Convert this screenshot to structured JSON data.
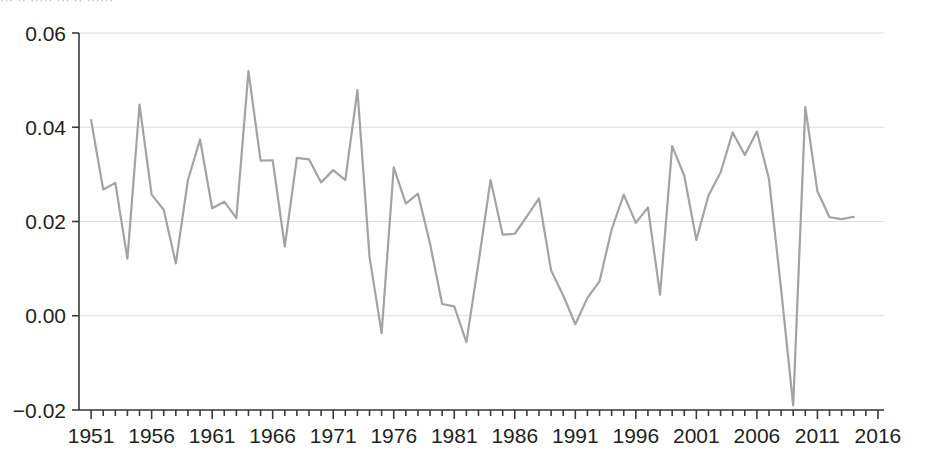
{
  "figure": {
    "clipped_header_text": "··· ·· ····· ··· ·· ······",
    "line_color": "#a3a3a3",
    "grid_color": "#dcdcdc",
    "axis_color": "#3a3a3a",
    "background_color": "#ffffff"
  },
  "chart_data": {
    "type": "line",
    "title": "",
    "xlabel": "",
    "ylabel": "",
    "xlim": [
      1950.0,
      2016.5
    ],
    "ylim": [
      -0.02,
      0.06
    ],
    "grid": true,
    "legend": null,
    "yticks": [
      -0.02,
      0.0,
      0.02,
      0.04,
      0.06
    ],
    "ytick_labels": [
      "−0.02",
      "0.00",
      "0.02",
      "0.04",
      "0.06"
    ],
    "xticks": [
      1951,
      1956,
      1961,
      1966,
      1971,
      1976,
      1981,
      1986,
      1991,
      1996,
      2001,
      2006,
      2011,
      2016
    ],
    "xtick_labels": [
      "1951",
      "1956",
      "1961",
      "1966",
      "1971",
      "1976",
      "1981",
      "1986",
      "1991",
      "1996",
      "2001",
      "2006",
      "2011",
      "2016"
    ],
    "xtick_minor_step": 1,
    "series": [
      {
        "name": "series-1",
        "color": "#a3a3a3",
        "x": [
          1951,
          1952,
          1953,
          1954,
          1955,
          1956,
          1957,
          1958,
          1959,
          1960,
          1961,
          1962,
          1963,
          1964,
          1965,
          1966,
          1967,
          1968,
          1969,
          1970,
          1971,
          1972,
          1973,
          1974,
          1975,
          1976,
          1977,
          1978,
          1979,
          1980,
          1981,
          1982,
          1983,
          1984,
          1985,
          1986,
          1987,
          1988,
          1989,
          1990,
          1991,
          1992,
          1993,
          1994,
          1995,
          1996,
          1997,
          1998,
          1999,
          2000,
          2001,
          2002,
          2003,
          2004,
          2005,
          2006,
          2007,
          2008,
          2009,
          2010,
          2011,
          2012,
          2013,
          2014
        ],
        "values": [
          0.0415,
          0.0268,
          0.0282,
          0.0121,
          0.0448,
          0.0257,
          0.0225,
          0.0111,
          0.0288,
          0.0374,
          0.0228,
          0.0242,
          0.0207,
          0.0519,
          0.0329,
          0.033,
          0.0147,
          0.0335,
          0.0332,
          0.0283,
          0.0309,
          0.0288,
          0.0479,
          0.0125,
          -0.0037,
          0.0315,
          0.0238,
          0.0259,
          0.0153,
          0.0025,
          0.002,
          -0.0056,
          0.0112,
          0.0288,
          0.0172,
          0.0174,
          0.0211,
          0.0249,
          0.0096,
          0.0043,
          -0.0018,
          0.0038,
          0.0073,
          0.0183,
          0.0257,
          0.0197,
          0.023,
          0.0045,
          0.036,
          0.0297,
          0.0161,
          0.0255,
          0.0304,
          0.0389,
          0.0341,
          0.0391,
          0.029,
          0.0056,
          -0.019,
          0.0443,
          0.0264,
          0.0209,
          0.0205,
          0.021
        ]
      }
    ]
  }
}
